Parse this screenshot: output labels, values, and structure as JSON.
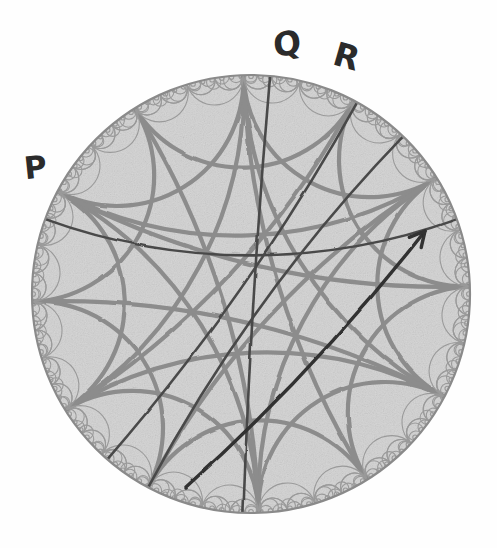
{
  "figure": {
    "kind": "hyperbolic-poincare-disk",
    "background_color": "#fefefe",
    "disk": {
      "center_x": 251,
      "center_y": 294,
      "radius": 219,
      "fill_color": "#d6d6d6",
      "boundary_color": "#8a8a8a",
      "boundary_width": 2.2
    },
    "tessellation": {
      "arc_color": "#8c8c8c",
      "arc_width": 4.2,
      "lace_color": "#9a9a9a",
      "lace_width": 1.1,
      "description": "order-6 ideal triangle style arc web with fractal lace fringe at the boundary"
    },
    "geodesics": {
      "color": "#4a4a4a",
      "width": 2.6
    },
    "arrow": {
      "color": "#303030",
      "width": 3.4,
      "tail_x": 186,
      "tail_y": 487,
      "head_x": 425,
      "head_y": 231,
      "head_size": 17,
      "description": "arrow drawn from lower-left interior toward upper-right boundary"
    }
  },
  "labels": [
    {
      "id": "P",
      "text": "P",
      "x": 24,
      "y": 152,
      "rotation": -6
    },
    {
      "id": "Q",
      "text": "Q",
      "x": 273,
      "y": 27,
      "rotation": -10
    },
    {
      "id": "R",
      "text": "R",
      "x": 334,
      "y": 40,
      "rotation": 16
    }
  ]
}
